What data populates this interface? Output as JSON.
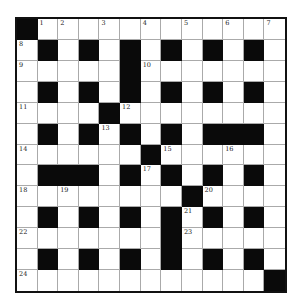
{
  "puzzle": {
    "rows": 13,
    "cols": 13,
    "colors": {
      "black": "#0a0a0a",
      "white": "#ffffff",
      "border": "#111111",
      "gridline": "#aaaaaa"
    },
    "layout": [
      "#............",
      ".#.#.#.#.#.#.",
      ".....#.......",
      ".#.#.#.#.#.#.",
      "....#........",
      ".#.#.#.#.###.",
      "......#......",
      ".###.#.#.#.#.",
      "........#....",
      ".#.#.#.#.#.#.",
      ".......#.....",
      ".#.#.#.#.#.#.",
      "............#"
    ],
    "numbers": [
      {
        "r": 0,
        "c": 1,
        "n": "1"
      },
      {
        "r": 0,
        "c": 2,
        "n": "2"
      },
      {
        "r": 0,
        "c": 4,
        "n": "3"
      },
      {
        "r": 0,
        "c": 6,
        "n": "4"
      },
      {
        "r": 0,
        "c": 8,
        "n": "5"
      },
      {
        "r": 0,
        "c": 10,
        "n": "6"
      },
      {
        "r": 0,
        "c": 12,
        "n": "7"
      },
      {
        "r": 1,
        "c": 0,
        "n": "8"
      },
      {
        "r": 2,
        "c": 0,
        "n": "9"
      },
      {
        "r": 2,
        "c": 6,
        "n": "10"
      },
      {
        "r": 4,
        "c": 0,
        "n": "11"
      },
      {
        "r": 4,
        "c": 5,
        "n": "12"
      },
      {
        "r": 5,
        "c": 4,
        "n": "13"
      },
      {
        "r": 6,
        "c": 0,
        "n": "14"
      },
      {
        "r": 6,
        "c": 7,
        "n": "15"
      },
      {
        "r": 6,
        "c": 10,
        "n": "16"
      },
      {
        "r": 7,
        "c": 6,
        "n": "17"
      },
      {
        "r": 8,
        "c": 0,
        "n": "18"
      },
      {
        "r": 8,
        "c": 2,
        "n": "19"
      },
      {
        "r": 8,
        "c": 9,
        "n": "20"
      },
      {
        "r": 9,
        "c": 8,
        "n": "21"
      },
      {
        "r": 10,
        "c": 0,
        "n": "22"
      },
      {
        "r": 10,
        "c": 8,
        "n": "23"
      },
      {
        "r": 12,
        "c": 0,
        "n": "24"
      }
    ]
  }
}
